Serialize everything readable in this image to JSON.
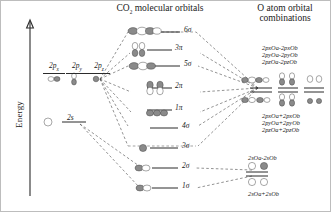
{
  "figure": {
    "axis_label": "Energy",
    "headers": {
      "center": "CO2 molecular orbitals",
      "center_formula_base": "CO",
      "center_formula_sub": "2",
      "center_formula_rest": " molecular orbitals",
      "right_line1": "O atom orbital",
      "right_line2": "combinations"
    }
  },
  "atomic_levels": [
    {
      "name": "2px",
      "base": "2p",
      "sub": "x",
      "orbital_icon": "p-orbital-horizontal"
    },
    {
      "name": "2py",
      "base": "2p",
      "sub": "y",
      "orbital_icon": "p-orbital-vertical"
    },
    {
      "name": "2pz",
      "base": "2p",
      "sub": "z",
      "orbital_icon": "p-orbital-axial"
    },
    {
      "name": "2s",
      "base": "2s",
      "sub": "",
      "orbital_icon": "s-orbital-circle"
    }
  ],
  "molecular_orbitals": [
    {
      "label": "6σ",
      "symbol": "6",
      "greek": "σ",
      "kind": "sigma",
      "icon": "sigma-antibonding-4lobe"
    },
    {
      "label": "3π",
      "symbol": "3",
      "greek": "π",
      "kind": "pi",
      "icon": "pi-antibonding-pair"
    },
    {
      "label": "5σ",
      "symbol": "5",
      "greek": "σ",
      "kind": "sigma",
      "icon": "sigma-antibonding-3lobe"
    },
    {
      "label": "2π",
      "symbol": "2",
      "greek": "π",
      "kind": "pi",
      "icon": "pi-nonbonding-pair"
    },
    {
      "label": "1π",
      "symbol": "1",
      "greek": "π",
      "kind": "pi",
      "icon": "pi-bonding-chain"
    },
    {
      "label": "4σ",
      "symbol": "4",
      "greek": "σ",
      "kind": "sigma",
      "icon": "sigma-level-plain"
    },
    {
      "label": "3σ",
      "symbol": "3",
      "greek": "σ",
      "kind": "sigma",
      "icon": "sigma-dark-lobe"
    },
    {
      "label": "2σ",
      "symbol": "2",
      "greek": "σ",
      "kind": "sigma",
      "icon": "sigma-bonding-2lobe"
    },
    {
      "label": "1σ",
      "symbol": "1",
      "greek": "σ",
      "kind": "sigma",
      "icon": "sigma-bonding-lowest"
    }
  ],
  "oxygen_combinations": {
    "antibonding_p": [
      "2pxOa-2pxOb",
      "2pyOa-2pyOb",
      "2pzOa-2pzOb"
    ],
    "bonding_p": [
      "2pxOa+2pxOb",
      "2pyOa+2pyOb",
      "2pzOa+2pzOb"
    ],
    "antibonding_s": "2sOa-2sOb",
    "bonding_s": "2sOa+2sOb"
  },
  "colors": {
    "ink": "#1a1a1a",
    "line": "#2b2b2b",
    "dash": "#4a4a4a",
    "lobe_dark": "#8a8a8a",
    "lobe_light": "#ffffff",
    "frame": "#bdbdbd"
  }
}
